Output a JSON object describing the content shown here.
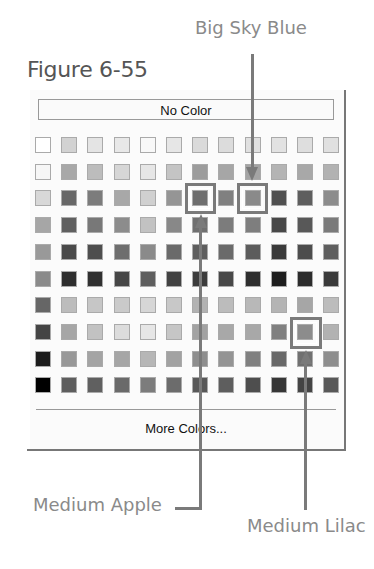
{
  "figure": {
    "caption": "Figure 6-55"
  },
  "callouts": {
    "big_sky_blue": "Big Sky Blue",
    "medium_apple": "Medium Apple",
    "medium_lilac": "Medium Lilac"
  },
  "palette": {
    "no_color_label": "No Color",
    "more_colors_label": "More Colors...",
    "columns": 12,
    "rows": 10,
    "swatches": [
      [
        "#ffffff",
        "#d2d2d2",
        "#e4e4e4",
        "#e8e8e8",
        "#f8f8f8",
        "#e6e6e6",
        "#dadada",
        "#dcdcdc",
        "#e0e0e0",
        "#e2e2e2",
        "#dedede",
        "#e0e0e0"
      ],
      [
        "#f6f6f6",
        "#a8a8a8",
        "#bcbcbc",
        "#d6d6d6",
        "#e6e6e6",
        "#c4c4c4",
        "#9c9c9c",
        "#a6a6a6",
        "#a4a4a4",
        "#b4b4b4",
        "#a8a8a8",
        "#b2b2b2"
      ],
      [
        "#d8d8d8",
        "#686868",
        "#7c7c7c",
        "#a8a8a8",
        "#d0d0d0",
        "#959595",
        "#6e6e6e",
        "#808080",
        "#8a8a8a",
        "#505050",
        "#5e5e5e",
        "#8c8c8c"
      ],
      [
        "#a6a6a6",
        "#606060",
        "#787878",
        "#8c8c8c",
        "#c2c2c2",
        "#888888",
        "#707070",
        "#7c7c7c",
        "#7e7e7e",
        "#484848",
        "#585858",
        "#7a7a7a"
      ],
      [
        "#999999",
        "#4a4a4a",
        "#4e4e4e",
        "#6e6e6e",
        "#8a8a8a",
        "#6a6a6a",
        "#5e5e5e",
        "#6a6a6a",
        "#5c5c5c",
        "#3a3a3a",
        "#4c4c4c",
        "#5e5e5e"
      ],
      [
        "#8a8a8a",
        "#2e2e2e",
        "#303030",
        "#464646",
        "#5e5e5e",
        "#424242",
        "#3c3c3c",
        "#484848",
        "#2e2e2e",
        "#1e1e1e",
        "#2c2c2c",
        "#3a3a3a"
      ],
      [
        "#666666",
        "#bcbcbc",
        "#c6c6c6",
        "#cacaca",
        "#d6d6d6",
        "#c8c8c8",
        "#b2b2b2",
        "#bcbcbc",
        "#b8b8b8",
        "#b4b4b4",
        "#a6a6a6",
        "#bcbcbc"
      ],
      [
        "#444444",
        "#a6a6a6",
        "#c2c2c2",
        "#dcdcdc",
        "#e6e6e6",
        "#c6c6c6",
        "#a2a2a2",
        "#a8a8a8",
        "#a8a8a8",
        "#808080",
        "#8c8c8c",
        "#b2b2b2"
      ],
      [
        "#1c1c1c",
        "#989898",
        "#a4a4a4",
        "#a6a6a6",
        "#b6b6b6",
        "#a2a2a2",
        "#8e8e8e",
        "#949494",
        "#808080",
        "#686868",
        "#707070",
        "#8e8e8e"
      ],
      [
        "#000000",
        "#5e5e5e",
        "#606060",
        "#6a6a6a",
        "#7c7c7c",
        "#6c6c6c",
        "#585858",
        "#5e5e5e",
        "#4e4e4e",
        "#363636",
        "#444444",
        "#585858"
      ]
    ],
    "highlighted": [
      {
        "name": "Medium Apple",
        "row": 2,
        "col": 6
      },
      {
        "name": "Big Sky Blue",
        "row": 2,
        "col": 8
      },
      {
        "name": "Medium Lilac",
        "row": 7,
        "col": 10
      }
    ]
  }
}
